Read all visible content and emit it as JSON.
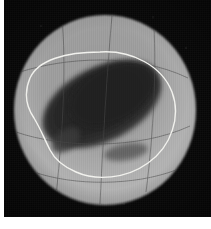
{
  "figure": {
    "kind": "planetary-disk-photograph",
    "background_color": "#070707",
    "page_margin_color": "#ffffff"
  },
  "disk": {
    "name": "planet-disk",
    "center_x": 105,
    "center_y": 110,
    "radius_x": 91,
    "radius_y": 95,
    "limb_color": "#b9b9b9",
    "mid_color": "#8d8d8d",
    "terminator_color": "#3a3a3a"
  },
  "albedo_feature": {
    "name": "dark-albedo-region",
    "fill_color": "#262626",
    "edge_color": "#3b3b3b",
    "orientation_deg": -27
  },
  "contour": {
    "name": "white-outline-contour",
    "stroke_color": "#f2f2ee",
    "stroke_width": 1.4,
    "closed": true
  },
  "graticule": {
    "name": "meridian-grid",
    "stroke_color": "#4a4a4a",
    "stroke_width": 0.7,
    "visible": true
  }
}
